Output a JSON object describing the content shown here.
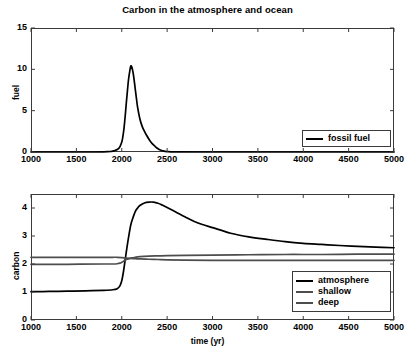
{
  "chart_data": [
    {
      "type": "line",
      "panel": "top",
      "title": "Carbon in the atmosphere and ocean",
      "xlabel": "",
      "ylabel": "fuel",
      "xlim": [
        1000,
        5000
      ],
      "ylim": [
        0,
        15
      ],
      "xticks": [
        1000,
        1500,
        2000,
        2500,
        3000,
        3500,
        4000,
        4500,
        5000
      ],
      "yticks": [
        0,
        5,
        10,
        15
      ],
      "grid": false,
      "legend_position": "lower right",
      "series": [
        {
          "name": "fossil fuel",
          "color": "#000000",
          "x": [
            1000,
            1500,
            1700,
            1800,
            1850,
            1875,
            1900,
            1925,
            1950,
            1975,
            1990,
            2000,
            2010,
            2025,
            2040,
            2050,
            2060,
            2075,
            2090,
            2100,
            2110,
            2125,
            2140,
            2150,
            2165,
            2175,
            2200,
            2225,
            2250,
            2275,
            2300,
            2325,
            2350,
            2375,
            2400,
            2425,
            2450,
            2500,
            2600,
            3000,
            4000,
            5000
          ],
          "y": [
            0.0,
            0.0,
            0.0,
            0.02,
            0.04,
            0.06,
            0.1,
            0.18,
            0.3,
            0.55,
            0.9,
            1.2,
            1.7,
            2.9,
            4.6,
            5.9,
            7.1,
            8.8,
            9.9,
            10.4,
            10.3,
            9.6,
            8.4,
            7.5,
            6.2,
            5.4,
            4.0,
            3.1,
            2.5,
            2.0,
            1.55,
            1.15,
            0.85,
            0.6,
            0.4,
            0.25,
            0.15,
            0.05,
            0.01,
            0.0,
            0.0,
            0.0
          ]
        }
      ]
    },
    {
      "type": "line",
      "panel": "bottom",
      "title": "",
      "xlabel": "time (yr)",
      "ylabel": "carbon",
      "xlim": [
        1000,
        5000
      ],
      "ylim": [
        0,
        4.5
      ],
      "xticks": [
        1000,
        1500,
        2000,
        2500,
        3000,
        3500,
        4000,
        4500,
        5000
      ],
      "yticks": [
        0,
        1,
        2,
        3,
        4
      ],
      "grid": false,
      "legend_position": "lower right",
      "series": [
        {
          "name": "atmosphere",
          "color": "#000000",
          "x": [
            1000,
            1200,
            1400,
            1600,
            1800,
            1900,
            1950,
            1980,
            2000,
            2020,
            2040,
            2060,
            2080,
            2100,
            2120,
            2150,
            2180,
            2200,
            2250,
            2300,
            2350,
            2400,
            2450,
            2500,
            2600,
            2700,
            2800,
            2900,
            3000,
            3200,
            3400,
            3600,
            3800,
            4000,
            4200,
            4400,
            4600,
            4800,
            5000
          ],
          "y": [
            1.01,
            1.02,
            1.03,
            1.04,
            1.06,
            1.08,
            1.12,
            1.22,
            1.4,
            1.75,
            2.2,
            2.65,
            3.05,
            3.4,
            3.62,
            3.88,
            4.02,
            4.09,
            4.18,
            4.21,
            4.21,
            4.17,
            4.1,
            4.02,
            3.85,
            3.68,
            3.52,
            3.4,
            3.3,
            3.1,
            2.97,
            2.88,
            2.8,
            2.74,
            2.7,
            2.66,
            2.63,
            2.6,
            2.58
          ]
        },
        {
          "name": "shallow",
          "color": "#4d4d4d",
          "x": [
            1000,
            1400,
            1800,
            1900,
            1950,
            1980,
            2000,
            2020,
            2040,
            2060,
            2080,
            2100,
            2150,
            2200,
            2300,
            2400,
            2500,
            2700,
            3000,
            3400,
            3800,
            4200,
            4600,
            5000
          ],
          "y": [
            1.99,
            1.99,
            2.0,
            2.0,
            2.01,
            2.03,
            2.06,
            2.1,
            2.14,
            2.17,
            2.19,
            2.21,
            2.24,
            2.26,
            2.28,
            2.29,
            2.3,
            2.31,
            2.32,
            2.33,
            2.34,
            2.34,
            2.35,
            2.35
          ]
        },
        {
          "name": "deep",
          "color": "#4d4d4d",
          "x": [
            1000,
            1400,
            1800,
            1900,
            1950,
            2000,
            2050,
            2100,
            2150,
            2200,
            2300,
            2400,
            2500,
            2700,
            3000,
            3400,
            3800,
            4200,
            4600,
            5000
          ],
          "y": [
            2.24,
            2.24,
            2.24,
            2.24,
            2.24,
            2.23,
            2.21,
            2.2,
            2.19,
            2.18,
            2.17,
            2.16,
            2.15,
            2.14,
            2.13,
            2.13,
            2.13,
            2.13,
            2.13,
            2.13
          ]
        }
      ]
    }
  ],
  "top_panel": {
    "ylabel": "fuel",
    "yticks": [
      "0",
      "5",
      "10",
      "15"
    ],
    "xticks": [
      "1000",
      "1500",
      "2000",
      "2500",
      "3000",
      "3500",
      "4000",
      "4500",
      "5000"
    ],
    "legend": [
      {
        "label": "fossil fuel",
        "color": "#000000"
      }
    ]
  },
  "bottom_panel": {
    "ylabel": "carbon",
    "xlabel": "time (yr)",
    "yticks": [
      "0",
      "1",
      "2",
      "3",
      "4"
    ],
    "xticks": [
      "1000",
      "1500",
      "2000",
      "2500",
      "3000",
      "3500",
      "4000",
      "4500",
      "5000"
    ],
    "legend": [
      {
        "label": "atmosphere",
        "color": "#000000"
      },
      {
        "label": "shallow",
        "color": "#4d4d4d"
      },
      {
        "label": "deep",
        "color": "#4d4d4d"
      }
    ]
  },
  "title": "Carbon in the atmosphere and ocean",
  "colors": {
    "axis": "#3b3b3b",
    "text": "#000000",
    "background": "#ffffff"
  }
}
